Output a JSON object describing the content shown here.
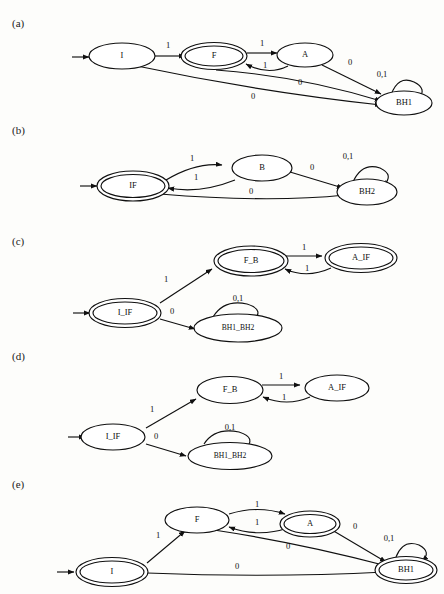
{
  "figure": {
    "panels": [
      {
        "id": "a",
        "label": "(a)",
        "states": [
          {
            "name": "I",
            "accepting": false,
            "start": true
          },
          {
            "name": "F",
            "accepting": true,
            "start": false
          },
          {
            "name": "A",
            "accepting": false,
            "start": false
          },
          {
            "name": "BH1",
            "accepting": false,
            "start": false
          }
        ],
        "transitions": [
          {
            "from": "I",
            "to": "F",
            "label": "1"
          },
          {
            "from": "I",
            "to": "BH1",
            "label": "0"
          },
          {
            "from": "F",
            "to": "A",
            "label": "1"
          },
          {
            "from": "A",
            "to": "F",
            "label": "1"
          },
          {
            "from": "A",
            "to": "BH1",
            "label": "0"
          },
          {
            "from": "F",
            "to": "BH1",
            "label": "0"
          },
          {
            "from": "BH1",
            "to": "BH1",
            "label": "0,1"
          }
        ]
      },
      {
        "id": "b",
        "label": "(b)",
        "states": [
          {
            "name": "IF",
            "accepting": true,
            "start": true
          },
          {
            "name": "B",
            "accepting": false,
            "start": false
          },
          {
            "name": "BH2",
            "accepting": false,
            "start": false
          }
        ],
        "transitions": [
          {
            "from": "IF",
            "to": "B",
            "label": "1"
          },
          {
            "from": "B",
            "to": "IF",
            "label": "1"
          },
          {
            "from": "B",
            "to": "BH2",
            "label": "0"
          },
          {
            "from": "IF",
            "to": "BH2",
            "label": "0"
          },
          {
            "from": "BH2",
            "to": "BH2",
            "label": "0,1"
          }
        ]
      },
      {
        "id": "c",
        "label": "(c)",
        "states": [
          {
            "name": "I_IF",
            "accepting": true,
            "start": true
          },
          {
            "name": "F_B",
            "accepting": true,
            "start": false
          },
          {
            "name": "A_IF",
            "accepting": true,
            "start": false
          },
          {
            "name": "BH1_BH2",
            "accepting": false,
            "start": false
          }
        ],
        "transitions": [
          {
            "from": "I_IF",
            "to": "F_B",
            "label": "1"
          },
          {
            "from": "I_IF",
            "to": "BH1_BH2",
            "label": "0"
          },
          {
            "from": "F_B",
            "to": "A_IF",
            "label": "1"
          },
          {
            "from": "A_IF",
            "to": "F_B",
            "label": "1"
          },
          {
            "from": "BH1_BH2",
            "to": "BH1_BH2",
            "label": "0,1"
          }
        ]
      },
      {
        "id": "d",
        "label": "(d)",
        "states": [
          {
            "name": "I_IF",
            "accepting": false,
            "start": true
          },
          {
            "name": "F_B",
            "accepting": false,
            "start": false
          },
          {
            "name": "A_IF",
            "accepting": false,
            "start": false
          },
          {
            "name": "BH1_BH2",
            "accepting": false,
            "start": false
          }
        ],
        "transitions": [
          {
            "from": "I_IF",
            "to": "F_B",
            "label": "1"
          },
          {
            "from": "I_IF",
            "to": "BH1_BH2",
            "label": "0"
          },
          {
            "from": "F_B",
            "to": "A_IF",
            "label": "1"
          },
          {
            "from": "A_IF",
            "to": "F_B",
            "label": "1"
          },
          {
            "from": "BH1_BH2",
            "to": "BH1_BH2",
            "label": "0,1"
          }
        ]
      },
      {
        "id": "e",
        "label": "(e)",
        "states": [
          {
            "name": "I",
            "accepting": true,
            "start": true
          },
          {
            "name": "F",
            "accepting": false,
            "start": false
          },
          {
            "name": "A",
            "accepting": true,
            "start": false
          },
          {
            "name": "BH1",
            "accepting": true,
            "start": false
          }
        ],
        "transitions": [
          {
            "from": "I",
            "to": "F",
            "label": "1"
          },
          {
            "from": "I",
            "to": "BH1",
            "label": "0"
          },
          {
            "from": "F",
            "to": "A",
            "label": "1"
          },
          {
            "from": "A",
            "to": "F",
            "label": "1"
          },
          {
            "from": "A",
            "to": "BH1",
            "label": "0"
          },
          {
            "from": "F",
            "to": "BH1",
            "label": "0"
          },
          {
            "from": "BH1",
            "to": "BH1",
            "label": "0,1"
          }
        ]
      }
    ]
  },
  "labels": {
    "a": "(a)",
    "b": "(b)",
    "c": "(c)",
    "d": "(d)",
    "e": "(e)"
  },
  "nodes": {
    "a": {
      "I": "I",
      "F": "F",
      "A": "A",
      "BH1": "BH1"
    },
    "b": {
      "IF": "IF",
      "B": "B",
      "BH2": "BH2"
    },
    "c": {
      "I_IF": "I_IF",
      "F_B": "F_B",
      "A_IF": "A_IF",
      "BH1_BH2": "BH1_BH2"
    },
    "d": {
      "I_IF": "I_IF",
      "F_B": "F_B",
      "A_IF": "A_IF",
      "BH1_BH2": "BH1_BH2"
    },
    "e": {
      "I": "I",
      "F": "F",
      "A": "A",
      "BH1": "BH1"
    }
  },
  "edge_labels": {
    "a": {
      "I_F": "1",
      "F_A": "1",
      "A_F": "1",
      "A_BH1": "0",
      "F_BH1": "0",
      "I_BH1": "0",
      "loop": "0,1"
    },
    "b": {
      "IF_B": "1",
      "B_IF": "1",
      "B_BH2": "0",
      "IF_BH2": "0",
      "loop": "0,1"
    },
    "c": {
      "I_F": "1",
      "I_BH": "0",
      "F_A": "1",
      "A_F": "1",
      "loop": "0,1"
    },
    "d": {
      "I_F": "1",
      "I_BH": "0",
      "F_A": "1",
      "A_F": "1",
      "loop": "0,1"
    },
    "e": {
      "I_F": "1",
      "F_A": "1",
      "A_F": "1",
      "A_BH1": "0",
      "F_BH1": "0",
      "I_BH1": "0",
      "loop": "0,1"
    }
  },
  "style": {
    "ink": "#101010",
    "paper": "#fdfdfb"
  }
}
